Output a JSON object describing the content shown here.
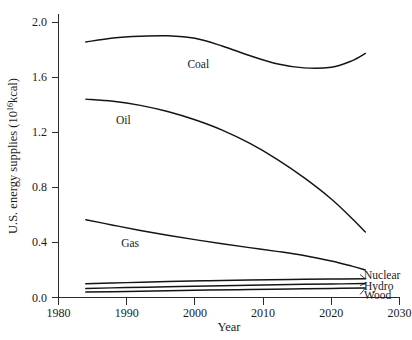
{
  "chart_data": {
    "type": "line",
    "title": "",
    "xlabel": "Year",
    "ylabel": "U.S. energy supplies (10^16 kcal)",
    "ylabel_prefix": "U.S. energy supplies (10",
    "ylabel_exponent": "16",
    "ylabel_suffix": "kcal)",
    "xlim": [
      1980,
      2030
    ],
    "ylim": [
      0.0,
      2.1
    ],
    "grid": false,
    "legend_position": "inline-right",
    "xticks": [
      1980,
      1990,
      2000,
      2010,
      2020,
      2030
    ],
    "xtick_labels": [
      "1980",
      "1990",
      "2000",
      "2010",
      "2020",
      "2030"
    ],
    "yticks": [
      0.0,
      0.4,
      0.8,
      1.2,
      1.6,
      2.0
    ],
    "ytick_labels": [
      "0.0",
      "0.4",
      "0.8",
      "1.2",
      "1.6",
      "2.0"
    ],
    "series": [
      {
        "name": "Coal",
        "label": "Coal",
        "label_position": "inline",
        "label_x": 2000.5,
        "label_y": 1.695,
        "x": [
          1984,
          1988,
          1992,
          1996,
          2000,
          2004,
          2008,
          2012,
          2016,
          2020,
          2023,
          2025
        ],
        "values": [
          1.855,
          1.884,
          1.897,
          1.9,
          1.882,
          1.826,
          1.757,
          1.697,
          1.667,
          1.672,
          1.718,
          1.772
        ]
      },
      {
        "name": "Oil",
        "label": "Oil",
        "label_position": "inline",
        "label_x": 1989.5,
        "label_y": 1.285,
        "x": [
          1984,
          1988,
          1992,
          1996,
          2000,
          2004,
          2008,
          2012,
          2016,
          2020,
          2023,
          2025
        ],
        "values": [
          1.44,
          1.425,
          1.395,
          1.35,
          1.29,
          1.215,
          1.12,
          1.005,
          0.87,
          0.715,
          0.575,
          0.475
        ]
      },
      {
        "name": "Gas",
        "label": "Gas",
        "label_position": "inline",
        "label_x": 1990.5,
        "label_y": 0.395,
        "x": [
          1984,
          1988,
          1992,
          1996,
          2000,
          2004,
          2008,
          2012,
          2016,
          2020,
          2023,
          2025
        ],
        "values": [
          0.565,
          0.525,
          0.487,
          0.452,
          0.42,
          0.39,
          0.362,
          0.335,
          0.305,
          0.265,
          0.228,
          0.2
        ]
      },
      {
        "name": "Nuclear",
        "label": "Nuclear",
        "label_position": "right-callout",
        "x": [
          1984,
          1990,
          1996,
          2002,
          2008,
          2014,
          2020,
          2025
        ],
        "values": [
          0.1,
          0.108,
          0.116,
          0.122,
          0.127,
          0.131,
          0.134,
          0.136
        ]
      },
      {
        "name": "Hydro",
        "label": "Hydro",
        "label_position": "right-callout",
        "x": [
          1984,
          1990,
          1996,
          2002,
          2008,
          2014,
          2020,
          2025
        ],
        "values": [
          0.066,
          0.072,
          0.078,
          0.084,
          0.089,
          0.094,
          0.098,
          0.101
        ]
      },
      {
        "name": "Wood",
        "label": "Wood",
        "label_position": "right-callout",
        "x": [
          1984,
          1990,
          1996,
          2002,
          2008,
          2014,
          2020,
          2025
        ],
        "values": [
          0.04,
          0.044,
          0.049,
          0.054,
          0.058,
          0.062,
          0.066,
          0.069
        ]
      }
    ]
  }
}
